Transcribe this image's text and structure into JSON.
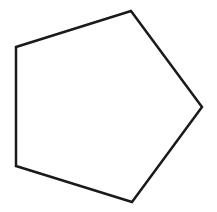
{
  "diagram": {
    "shape": "pentagon",
    "background": "#ffffff",
    "stroke_color": "#1a1a1a",
    "fill_color": "#ffffff",
    "stroke_width": 2.5,
    "vertices": [
      {
        "x": 131,
        "y": 11
      },
      {
        "x": 202,
        "y": 107
      },
      {
        "x": 132,
        "y": 202
      },
      {
        "x": 16,
        "y": 166
      },
      {
        "x": 16,
        "y": 47
      }
    ],
    "points": "131,11 202,107 132,202 16,166 16,47"
  }
}
